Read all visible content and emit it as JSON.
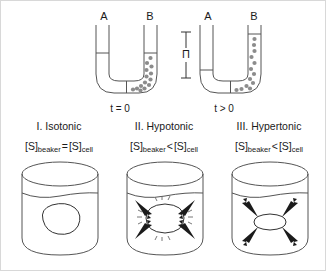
{
  "figure": {
    "background_color": "#ffffff",
    "border_color": "#d8d8d8",
    "line_color": "#555555",
    "solute_color": "#8c8c8c",
    "arrow_color": "#1b1b1b"
  },
  "osmometer": {
    "tubes": [
      {
        "id": "tube-initial",
        "arm_labels": [
          "A",
          "B"
        ],
        "time_label": "t = 0",
        "level_state": "equal",
        "solute_side": "B",
        "solute_count": 14
      },
      {
        "id": "tube-equilibrium",
        "arm_labels": [
          "A",
          "B"
        ],
        "time_label": "t > 0",
        "level_state": "unequal",
        "solute_side": "B",
        "solute_count": 13,
        "pressure_symbol": "Π"
      }
    ]
  },
  "panels": [
    {
      "id": "isotonic",
      "title": "I. Isotonic",
      "formula": {
        "left_species": "S",
        "left_subscript": "beaker",
        "relation": "=",
        "right_species": "S",
        "right_subscript": "cell"
      },
      "cell_state": "normal",
      "arrows": "none",
      "burst_marks": false
    },
    {
      "id": "hypotonic",
      "title": "II. Hypotonic",
      "formula": {
        "left_species": "S",
        "left_subscript": "beaker",
        "relation": "<",
        "right_species": "S",
        "right_subscript": "cell"
      },
      "cell_state": "swollen",
      "arrows": "inward",
      "arrow_count": 4,
      "burst_marks": true
    },
    {
      "id": "hypertonic",
      "title": "III. Hypertonic",
      "formula": {
        "left_species": "S",
        "left_subscript": "beaker",
        "relation": "<",
        "right_species": "S",
        "right_subscript": "cell"
      },
      "cell_state": "shrunken",
      "arrows": "outward",
      "arrow_count": 4,
      "burst_marks": false
    }
  ]
}
